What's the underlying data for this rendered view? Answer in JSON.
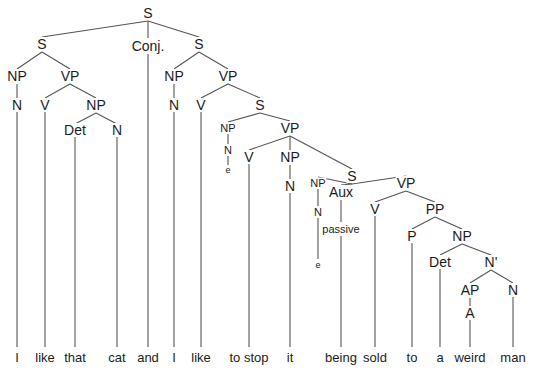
{
  "diagram": {
    "type": "syntax-tree",
    "sentence": "I like that cat and I like to stop it being sold to a weird man",
    "line_color": "#555555",
    "text_color": "#1c1c1c",
    "background_color": "#ffffff",
    "nodes": [
      {
        "id": "n0",
        "label": "S",
        "x": 148,
        "y": 13,
        "size": "cat"
      },
      {
        "id": "n1",
        "label": "S",
        "x": 42,
        "y": 44,
        "size": "cat"
      },
      {
        "id": "n2",
        "label": "Conj.",
        "x": 148,
        "y": 46,
        "size": "cat"
      },
      {
        "id": "n3",
        "label": "S",
        "x": 199,
        "y": 44,
        "size": "cat"
      },
      {
        "id": "n4",
        "label": "NP",
        "x": 17,
        "y": 76,
        "size": "cat"
      },
      {
        "id": "n5",
        "label": "VP",
        "x": 70,
        "y": 76,
        "size": "cat"
      },
      {
        "id": "n6",
        "label": "N",
        "x": 17,
        "y": 105,
        "size": "cat"
      },
      {
        "id": "n7",
        "label": "V",
        "x": 45,
        "y": 105,
        "size": "cat"
      },
      {
        "id": "n8",
        "label": "NP",
        "x": 96,
        "y": 105,
        "size": "cat"
      },
      {
        "id": "n9",
        "label": "Det",
        "x": 75,
        "y": 130,
        "size": "cat"
      },
      {
        "id": "n10",
        "label": "N",
        "x": 117,
        "y": 130,
        "size": "cat"
      },
      {
        "id": "n11",
        "label": "NP",
        "x": 174,
        "y": 76,
        "size": "cat"
      },
      {
        "id": "n12",
        "label": "VP",
        "x": 228,
        "y": 76,
        "size": "cat"
      },
      {
        "id": "n13",
        "label": "N",
        "x": 174,
        "y": 105,
        "size": "cat"
      },
      {
        "id": "n14",
        "label": "V",
        "x": 201,
        "y": 105,
        "size": "cat"
      },
      {
        "id": "n15",
        "label": "S",
        "x": 260,
        "y": 105,
        "size": "cat"
      },
      {
        "id": "n16",
        "label": "NP",
        "x": 228,
        "y": 128,
        "size": "cat-small"
      },
      {
        "id": "n17",
        "label": "N",
        "x": 228,
        "y": 150,
        "size": "cat-small"
      },
      {
        "id": "n18",
        "label": "e",
        "x": 228,
        "y": 170,
        "size": "cat-tiny"
      },
      {
        "id": "n19",
        "label": "VP",
        "x": 290,
        "y": 128,
        "size": "cat"
      },
      {
        "id": "n20",
        "label": "V",
        "x": 249,
        "y": 157,
        "size": "cat"
      },
      {
        "id": "n21",
        "label": "NP",
        "x": 290,
        "y": 157,
        "size": "cat"
      },
      {
        "id": "n22",
        "label": "N",
        "x": 290,
        "y": 186,
        "size": "cat"
      },
      {
        "id": "n23",
        "label": "S",
        "x": 352,
        "y": 176,
        "size": "cat"
      },
      {
        "id": "n24",
        "label": "NP",
        "x": 318,
        "y": 183,
        "size": "cat-small"
      },
      {
        "id": "n25",
        "label": "Aux",
        "x": 341,
        "y": 192,
        "size": "cat"
      },
      {
        "id": "n26",
        "label": "N",
        "x": 318,
        "y": 212,
        "size": "cat-small"
      },
      {
        "id": "n27",
        "label": "passive",
        "x": 341,
        "y": 229,
        "size": "cat-small"
      },
      {
        "id": "n28",
        "label": "e",
        "x": 318,
        "y": 265,
        "size": "cat-tiny"
      },
      {
        "id": "n29",
        "label": "VP",
        "x": 406,
        "y": 183,
        "size": "cat"
      },
      {
        "id": "n30",
        "label": "V",
        "x": 375,
        "y": 209,
        "size": "cat"
      },
      {
        "id": "n31",
        "label": "PP",
        "x": 435,
        "y": 209,
        "size": "cat"
      },
      {
        "id": "n32",
        "label": "P",
        "x": 412,
        "y": 236,
        "size": "cat"
      },
      {
        "id": "n33",
        "label": "NP",
        "x": 462,
        "y": 236,
        "size": "cat"
      },
      {
        "id": "n34",
        "label": "Det",
        "x": 440,
        "y": 262,
        "size": "cat"
      },
      {
        "id": "n35",
        "label": "N'",
        "x": 491,
        "y": 262,
        "size": "cat"
      },
      {
        "id": "n36",
        "label": "AP",
        "x": 470,
        "y": 290,
        "size": "cat"
      },
      {
        "id": "n37",
        "label": "N",
        "x": 513,
        "y": 290,
        "size": "cat"
      },
      {
        "id": "n38",
        "label": "A",
        "x": 470,
        "y": 313,
        "size": "cat"
      }
    ],
    "edges": [
      {
        "x1": 148,
        "y1": 21,
        "x2": 42,
        "y2": 37
      },
      {
        "x1": 148,
        "y1": 21,
        "x2": 148,
        "y2": 38
      },
      {
        "x1": 148,
        "y1": 21,
        "x2": 199,
        "y2": 37
      },
      {
        "x1": 42,
        "y1": 52,
        "x2": 17,
        "y2": 69
      },
      {
        "x1": 42,
        "y1": 52,
        "x2": 70,
        "y2": 69
      },
      {
        "x1": 17,
        "y1": 84,
        "x2": 17,
        "y2": 98
      },
      {
        "x1": 70,
        "y1": 84,
        "x2": 45,
        "y2": 98
      },
      {
        "x1": 70,
        "y1": 84,
        "x2": 96,
        "y2": 98
      },
      {
        "x1": 96,
        "y1": 113,
        "x2": 75,
        "y2": 124
      },
      {
        "x1": 96,
        "y1": 113,
        "x2": 117,
        "y2": 124
      },
      {
        "x1": 199,
        "y1": 52,
        "x2": 174,
        "y2": 69
      },
      {
        "x1": 199,
        "y1": 52,
        "x2": 228,
        "y2": 69
      },
      {
        "x1": 174,
        "y1": 84,
        "x2": 174,
        "y2": 98
      },
      {
        "x1": 228,
        "y1": 84,
        "x2": 201,
        "y2": 98
      },
      {
        "x1": 228,
        "y1": 84,
        "x2": 260,
        "y2": 98
      },
      {
        "x1": 260,
        "y1": 113,
        "x2": 228,
        "y2": 122
      },
      {
        "x1": 260,
        "y1": 113,
        "x2": 290,
        "y2": 121
      },
      {
        "x1": 228,
        "y1": 134,
        "x2": 228,
        "y2": 144
      },
      {
        "x1": 228,
        "y1": 156,
        "x2": 228,
        "y2": 165
      },
      {
        "x1": 290,
        "y1": 136,
        "x2": 249,
        "y2": 150
      },
      {
        "x1": 290,
        "y1": 136,
        "x2": 290,
        "y2": 150
      },
      {
        "x1": 290,
        "y1": 136,
        "x2": 352,
        "y2": 169
      },
      {
        "x1": 290,
        "y1": 165,
        "x2": 290,
        "y2": 179
      },
      {
        "x1": 352,
        "y1": 184,
        "x2": 318,
        "y2": 177
      },
      {
        "x1": 352,
        "y1": 184,
        "x2": 341,
        "y2": 185
      },
      {
        "x1": 352,
        "y1": 184,
        "x2": 406,
        "y2": 176
      },
      {
        "x1": 318,
        "y1": 189,
        "x2": 318,
        "y2": 206
      },
      {
        "x1": 318,
        "y1": 218,
        "x2": 318,
        "y2": 259
      },
      {
        "x1": 341,
        "y1": 200,
        "x2": 341,
        "y2": 222
      },
      {
        "x1": 406,
        "y1": 191,
        "x2": 375,
        "y2": 202
      },
      {
        "x1": 406,
        "y1": 191,
        "x2": 435,
        "y2": 202
      },
      {
        "x1": 435,
        "y1": 217,
        "x2": 412,
        "y2": 229
      },
      {
        "x1": 435,
        "y1": 217,
        "x2": 462,
        "y2": 229
      },
      {
        "x1": 462,
        "y1": 244,
        "x2": 440,
        "y2": 255
      },
      {
        "x1": 462,
        "y1": 244,
        "x2": 491,
        "y2": 255
      },
      {
        "x1": 491,
        "y1": 270,
        "x2": 470,
        "y2": 283
      },
      {
        "x1": 491,
        "y1": 270,
        "x2": 513,
        "y2": 283
      },
      {
        "x1": 470,
        "y1": 298,
        "x2": 470,
        "y2": 306
      }
    ],
    "leaf_stems": [
      {
        "x": 17,
        "y1": 112,
        "y2": 347
      },
      {
        "x": 45,
        "y1": 112,
        "y2": 347
      },
      {
        "x": 75,
        "y1": 137,
        "y2": 347
      },
      {
        "x": 117,
        "y1": 137,
        "y2": 347
      },
      {
        "x": 148,
        "y1": 54,
        "y2": 347
      },
      {
        "x": 174,
        "y1": 112,
        "y2": 347
      },
      {
        "x": 201,
        "y1": 112,
        "y2": 347
      },
      {
        "x": 249,
        "y1": 164,
        "y2": 347
      },
      {
        "x": 290,
        "y1": 193,
        "y2": 347
      },
      {
        "x": 341,
        "y1": 236,
        "y2": 347
      },
      {
        "x": 375,
        "y1": 216,
        "y2": 347
      },
      {
        "x": 412,
        "y1": 243,
        "y2": 347
      },
      {
        "x": 440,
        "y1": 269,
        "y2": 347
      },
      {
        "x": 470,
        "y1": 320,
        "y2": 347
      },
      {
        "x": 513,
        "y1": 297,
        "y2": 347
      }
    ],
    "leaves": [
      {
        "text": "I",
        "x": 17,
        "y": 351
      },
      {
        "text": "like",
        "x": 45,
        "y": 351
      },
      {
        "text": "that",
        "x": 75,
        "y": 351
      },
      {
        "text": "cat",
        "x": 117,
        "y": 351
      },
      {
        "text": "and",
        "x": 148,
        "y": 351
      },
      {
        "text": "I",
        "x": 174,
        "y": 351
      },
      {
        "text": "like",
        "x": 201,
        "y": 351
      },
      {
        "text": "to stop",
        "x": 249,
        "y": 351
      },
      {
        "text": "it",
        "x": 290,
        "y": 351
      },
      {
        "text": "being",
        "x": 341,
        "y": 351
      },
      {
        "text": "sold",
        "x": 375,
        "y": 351
      },
      {
        "text": "to",
        "x": 412,
        "y": 351
      },
      {
        "text": "a",
        "x": 440,
        "y": 351
      },
      {
        "text": "weird",
        "x": 470,
        "y": 351
      },
      {
        "text": "man",
        "x": 513,
        "y": 351
      }
    ]
  }
}
